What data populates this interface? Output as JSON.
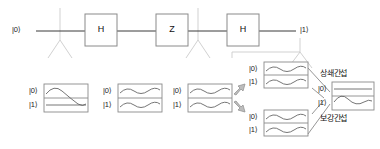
{
  "diagram": {
    "colors": {
      "wire": "#3a3a3a",
      "branch": "#c8c8c8",
      "box_border": "#8a8a8a",
      "wave": "#555555",
      "arrow_fill": "#b9b9b9",
      "arrow_border": "#8f8f8f",
      "text": "#1a1a1a",
      "background": "#ffffff"
    },
    "circuit": {
      "input_label": "|0⟩",
      "output_label": "|1⟩",
      "gates": [
        {
          "name": "hadamard-gate-1",
          "label": "H"
        },
        {
          "name": "z-gate",
          "label": "Z"
        },
        {
          "name": "hadamard-gate-2",
          "label": "H"
        }
      ]
    },
    "state_groups": [
      {
        "name": "state-group-initial",
        "rows": [
          {
            "ket": "|0⟩",
            "wave": "sine"
          },
          {
            "ket": "|1⟩",
            "wave": "flat"
          }
        ]
      },
      {
        "name": "state-group-after-h1",
        "rows": [
          {
            "ket": "|0⟩",
            "wave": "sine"
          },
          {
            "ket": "|1⟩",
            "wave": "sine"
          }
        ]
      },
      {
        "name": "state-group-after-z",
        "rows": [
          {
            "ket": "|0⟩",
            "wave": "sine"
          },
          {
            "ket": "|1⟩",
            "wave": "sine"
          }
        ]
      },
      {
        "name": "state-group-branch-top",
        "rows": [
          {
            "ket": "|0⟩",
            "wave": "sine"
          },
          {
            "ket": "|1⟩",
            "wave": "sine"
          }
        ]
      },
      {
        "name": "state-group-branch-bottom",
        "rows": [
          {
            "ket": "|0⟩",
            "wave": "sine"
          },
          {
            "ket": "|1⟩",
            "wave": "sine"
          }
        ]
      },
      {
        "name": "state-group-result",
        "rows": [
          {
            "ket": "|0⟩",
            "wave": "flat"
          },
          {
            "ket": "|1⟩",
            "wave": "sine"
          }
        ]
      }
    ],
    "annotations": {
      "destructive": "상쇄간섭",
      "constructive": "보강간섭"
    }
  }
}
